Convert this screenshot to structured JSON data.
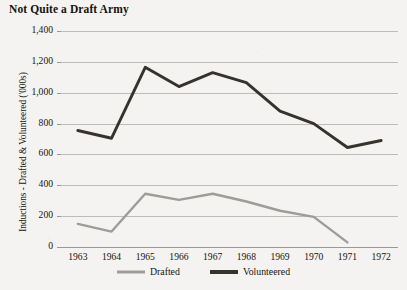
{
  "chart_data": {
    "type": "line",
    "title": "Not Quite a Draft Army",
    "xlabel": "",
    "ylabel": "Inductions - Drafted & Volunteered ('000s)",
    "categories": [
      "1963",
      "1964",
      "1965",
      "1966",
      "1967",
      "1968",
      "1969",
      "1970",
      "1971",
      "1972"
    ],
    "x": [
      1963,
      1964,
      1965,
      1966,
      1967,
      1968,
      1969,
      1970,
      1971,
      1972
    ],
    "series": [
      {
        "name": "Drafted",
        "color": "#9c9c99",
        "values": [
          150,
          100,
          345,
          305,
          345,
          295,
          235,
          195,
          30,
          null
        ]
      },
      {
        "name": "Volunteered",
        "color": "#36332f",
        "values": [
          755,
          705,
          1165,
          1040,
          1130,
          1065,
          880,
          800,
          645,
          690
        ]
      }
    ],
    "ylim": [
      0,
      1400
    ],
    "yticks": [
      "0",
      "200",
      "400",
      "600",
      "800",
      "1,000",
      "1,200",
      "1,400"
    ],
    "ytick_values": [
      0,
      200,
      400,
      600,
      800,
      1000,
      1200,
      1400
    ],
    "grid": true,
    "legend_position": "bottom"
  },
  "legend": {
    "items": [
      {
        "label": "Drafted",
        "color": "#9c9c99",
        "thickness": 3
      },
      {
        "label": "Volunteered",
        "color": "#36332f",
        "thickness": 4
      }
    ]
  },
  "colors": {
    "background": "#f4f3f1",
    "gridline": "#bdbcb8",
    "axis": "#9a9894",
    "text": "#17150f"
  }
}
